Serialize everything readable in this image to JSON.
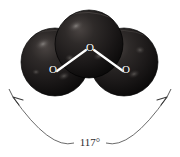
{
  "figure": {
    "molecule": "O3",
    "background_color": "#ffffff",
    "sphere_color": "#231f20",
    "sphere_shade_dark": "#0d0b0c",
    "sphere_highlight_color": "#6e6a68",
    "bond_color": "#ffffff",
    "annotation_color": "#2b2b2b"
  },
  "atoms": [
    {
      "label": "O",
      "name": "oxygen-atom-left",
      "cx": 55,
      "cy": 62,
      "r": 34,
      "label_x": 53,
      "label_y": 70
    },
    {
      "label": "O",
      "name": "oxygen-atom-center",
      "cx": 89,
      "cy": 44,
      "r": 34,
      "label_x": 90,
      "label_y": 48
    },
    {
      "label": "O",
      "name": "oxygen-atom-right",
      "cx": 124,
      "cy": 62,
      "r": 34,
      "label_x": 126,
      "label_y": 70
    }
  ],
  "bonds": [
    {
      "name": "bond-left-center",
      "x1": 57,
      "y1": 71,
      "x2": 86,
      "y2": 50
    },
    {
      "name": "bond-center-right",
      "x1": 94,
      "y1": 50,
      "x2": 123,
      "y2": 71
    }
  ],
  "annotation": {
    "angle_value": "117°",
    "angle_label_x": 90,
    "angle_label_y": 143,
    "arc_left_end_x": 13,
    "arc_left_end_y": 97,
    "arc_right_end_x": 167,
    "arc_right_end_y": 97
  }
}
